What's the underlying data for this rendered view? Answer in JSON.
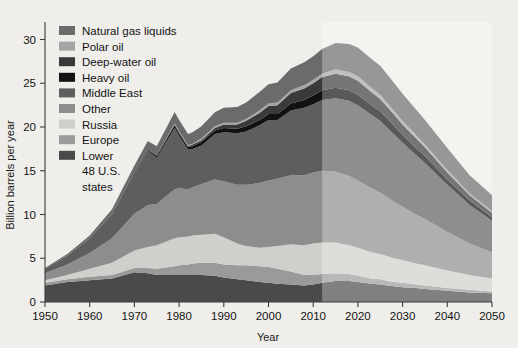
{
  "chart_data": {
    "type": "area",
    "title": "",
    "subtitle": "",
    "xlabel": "Year",
    "ylabel": "Billion barrels per year",
    "xlim": [
      1950,
      2050
    ],
    "ylim": [
      0,
      32
    ],
    "xticks": [
      1950,
      1960,
      1970,
      1980,
      1990,
      2000,
      2010,
      2020,
      2030,
      2040,
      2050
    ],
    "yticks": [
      0,
      5,
      10,
      15,
      20,
      25,
      30
    ],
    "grid": false,
    "stacked": true,
    "legend_position": "top-left",
    "projection_start_year": 2012,
    "projection_note": "shaded lighter region right of 2012 indicates projected values",
    "x": [
      1950,
      1955,
      1960,
      1965,
      1970,
      1973,
      1975,
      1979,
      1980,
      1982,
      1983,
      1985,
      1988,
      1990,
      1993,
      1995,
      1998,
      2000,
      2002,
      2005,
      2008,
      2010,
      2012,
      2015,
      2018,
      2020,
      2023,
      2025,
      2028,
      2030,
      2033,
      2035,
      2040,
      2045,
      2050
    ],
    "series": [
      {
        "name": "Lower 48 U.S. states",
        "color": "#4a4a4a",
        "values": [
          1.9,
          2.3,
          2.5,
          2.7,
          3.4,
          3.3,
          3.1,
          3.1,
          3.1,
          3.1,
          3.1,
          3.1,
          3.0,
          2.8,
          2.6,
          2.5,
          2.3,
          2.2,
          2.1,
          2.0,
          1.9,
          2.0,
          2.2,
          2.4,
          2.4,
          2.3,
          2.1,
          2.0,
          1.8,
          1.7,
          1.6,
          1.5,
          1.3,
          1.1,
          1.0
        ]
      },
      {
        "name": "Europe",
        "color": "#9a9a9a",
        "values": [
          0.3,
          0.3,
          0.4,
          0.4,
          0.5,
          0.6,
          0.7,
          1.0,
          1.1,
          1.2,
          1.3,
          1.4,
          1.5,
          1.5,
          1.6,
          1.7,
          1.8,
          1.8,
          1.7,
          1.5,
          1.2,
          1.1,
          1.0,
          0.9,
          0.8,
          0.7,
          0.6,
          0.6,
          0.5,
          0.5,
          0.4,
          0.4,
          0.3,
          0.3,
          0.2
        ]
      },
      {
        "name": "Russia",
        "color": "#cfcfcb",
        "values": [
          0.3,
          0.5,
          0.9,
          1.4,
          2.0,
          2.4,
          2.7,
          3.2,
          3.2,
          3.2,
          3.2,
          3.2,
          3.3,
          3.1,
          2.5,
          2.2,
          2.1,
          2.3,
          2.6,
          3.1,
          3.4,
          3.6,
          3.6,
          3.5,
          3.3,
          3.2,
          3.0,
          2.9,
          2.7,
          2.6,
          2.4,
          2.3,
          2.0,
          1.7,
          1.5
        ]
      },
      {
        "name": "Other",
        "color": "#8d8d8d",
        "values": [
          0.8,
          1.2,
          1.8,
          2.8,
          4.2,
          4.8,
          4.7,
          5.6,
          5.6,
          5.4,
          5.5,
          5.8,
          6.2,
          6.4,
          6.7,
          7.0,
          7.4,
          7.6,
          7.7,
          7.9,
          8.0,
          8.1,
          8.2,
          8.1,
          7.9,
          7.7,
          7.3,
          7.0,
          6.5,
          6.1,
          5.6,
          5.3,
          4.4,
          3.6,
          3.0
        ]
      },
      {
        "name": "Middle East",
        "color": "#5e5e5e",
        "values": [
          0.5,
          1.0,
          1.7,
          2.8,
          4.6,
          6.2,
          5.3,
          7.0,
          6.0,
          4.5,
          4.4,
          4.4,
          5.2,
          5.6,
          5.9,
          6.1,
          6.6,
          6.9,
          6.7,
          7.4,
          7.7,
          7.8,
          8.1,
          8.4,
          8.6,
          8.6,
          8.4,
          8.2,
          7.7,
          7.3,
          6.8,
          6.4,
          5.4,
          4.4,
          3.6
        ]
      },
      {
        "name": "Heavy oil",
        "color": "#121212",
        "values": [
          0.0,
          0.0,
          0.0,
          0.0,
          0.1,
          0.1,
          0.2,
          0.3,
          0.3,
          0.3,
          0.3,
          0.4,
          0.4,
          0.5,
          0.5,
          0.6,
          0.6,
          0.7,
          0.7,
          0.8,
          0.9,
          1.0,
          1.1,
          1.2,
          1.2,
          1.2,
          1.1,
          1.1,
          1.0,
          0.9,
          0.8,
          0.8,
          0.6,
          0.5,
          0.4
        ]
      },
      {
        "name": "Deep-water oil",
        "color": "#3a3a3a",
        "values": [
          0.0,
          0.0,
          0.0,
          0.0,
          0.0,
          0.0,
          0.1,
          0.1,
          0.1,
          0.1,
          0.2,
          0.2,
          0.3,
          0.4,
          0.5,
          0.6,
          0.8,
          0.9,
          1.0,
          1.2,
          1.3,
          1.4,
          1.5,
          1.6,
          1.6,
          1.6,
          1.5,
          1.4,
          1.3,
          1.2,
          1.1,
          1.0,
          0.8,
          0.6,
          0.5
        ]
      },
      {
        "name": "Polar oil",
        "color": "#a5a5a5",
        "values": [
          0.0,
          0.0,
          0.0,
          0.0,
          0.0,
          0.0,
          0.0,
          0.1,
          0.1,
          0.1,
          0.1,
          0.2,
          0.2,
          0.2,
          0.2,
          0.2,
          0.3,
          0.3,
          0.3,
          0.3,
          0.4,
          0.4,
          0.4,
          0.5,
          0.5,
          0.5,
          0.5,
          0.5,
          0.4,
          0.4,
          0.4,
          0.3,
          0.3,
          0.2,
          0.2
        ]
      },
      {
        "name": "Natural gas liquids",
        "color": "#6b6b6b",
        "values": [
          0.1,
          0.2,
          0.3,
          0.5,
          0.8,
          1.0,
          1.0,
          1.3,
          1.3,
          1.3,
          1.3,
          1.4,
          1.6,
          1.7,
          1.8,
          1.9,
          2.1,
          2.2,
          2.3,
          2.5,
          2.6,
          2.7,
          2.8,
          3.0,
          3.2,
          3.3,
          3.3,
          3.3,
          3.2,
          3.1,
          2.9,
          2.8,
          2.5,
          2.1,
          1.8
        ]
      }
    ],
    "legend": [
      {
        "label": "Natural gas liquids",
        "color": "#6b6b6b"
      },
      {
        "label": "Polar oil",
        "color": "#a5a5a5"
      },
      {
        "label": "Deep-water oil",
        "color": "#3a3a3a"
      },
      {
        "label": "Heavy oil",
        "color": "#121212"
      },
      {
        "label": "Middle East",
        "color": "#5e5e5e"
      },
      {
        "label": "Other",
        "color": "#8d8d8d"
      },
      {
        "label": "Russia",
        "color": "#cfcfcb"
      },
      {
        "label": "Europe",
        "color": "#9a9a9a"
      },
      {
        "label": "Lower 48 U.S. states",
        "color": "#4a4a4a"
      }
    ],
    "legend_last_entry_lines": [
      "Lower",
      "48 U.S.",
      "states"
    ]
  },
  "axes": {
    "y_label": "Billion barrels per year",
    "x_label": "Year",
    "y_ticks": [
      "0",
      "5",
      "10",
      "15",
      "20",
      "25",
      "30"
    ],
    "x_ticks": [
      "1950",
      "1960",
      "1970",
      "1980",
      "1990",
      "2000",
      "2010",
      "2020",
      "2030",
      "2040",
      "2050"
    ]
  },
  "legend": {
    "items": [
      {
        "label": "Natural gas liquids"
      },
      {
        "label": "Polar oil"
      },
      {
        "label": "Deep-water oil"
      },
      {
        "label": "Heavy oil"
      },
      {
        "label": "Middle East"
      },
      {
        "label": "Other"
      },
      {
        "label": "Russia"
      },
      {
        "label": "Europe"
      },
      {
        "label": "Lower"
      },
      {
        "label": "48 U.S."
      },
      {
        "label": "states"
      }
    ]
  },
  "colors": {
    "background": "#efeeea",
    "plot_background": "#efeeea",
    "axis": "#3c3c3c",
    "text": "#131313",
    "projection_overlay": "rgba(255,255,255,0.30)"
  }
}
